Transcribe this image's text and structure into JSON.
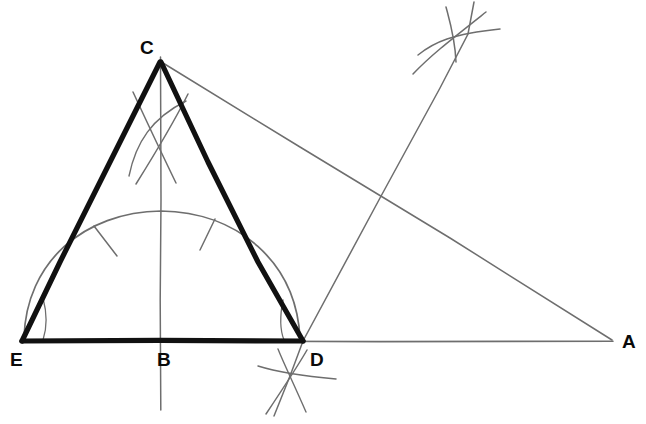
{
  "figure": {
    "canvas": {
      "width": 646,
      "height": 424
    },
    "colors": {
      "background": "#ffffff",
      "heavy_stroke": "#111111",
      "light_stroke": "#6e6e6e",
      "label_text": "#0a0a0a"
    },
    "points": {
      "C": {
        "label": "C",
        "x": 161,
        "y": 62,
        "label_x": 140,
        "label_y": 38
      },
      "E": {
        "label": "E",
        "x": 22,
        "y": 341,
        "label_x": 10,
        "label_y": 350
      },
      "B": {
        "label": "B",
        "x": 161,
        "y": 341,
        "label_x": 157,
        "label_y": 350
      },
      "D": {
        "label": "D",
        "x": 303,
        "y": 341,
        "label_x": 310,
        "label_y": 350
      },
      "A": {
        "label": "A",
        "x": 613,
        "y": 341,
        "label_x": 622,
        "label_y": 332
      }
    },
    "segments": [
      {
        "name": "triangle-side-CE",
        "from": "C",
        "to": "E",
        "weight": "heavy"
      },
      {
        "name": "triangle-side-CD",
        "from": "C",
        "to": "D",
        "weight": "heavy"
      },
      {
        "name": "triangle-base-ED",
        "from": "E",
        "to": "D",
        "weight": "heavy"
      },
      {
        "name": "baseline-DA",
        "from": "D",
        "to": "A",
        "weight": "light"
      },
      {
        "name": "hypotenuse-CA",
        "from": "C",
        "to": "A",
        "weight": "light"
      },
      {
        "name": "vertical-axis-through-B",
        "weight": "light"
      },
      {
        "name": "oblique-bisector-through-D",
        "weight": "light"
      }
    ],
    "arcs": {
      "semicircle_ED": {
        "name": "semicircle-on-ED",
        "center_x": 161,
        "center_y": 341,
        "radius": 141
      },
      "tick_left": {
        "name": "semicircle-tick-left"
      },
      "tick_right": {
        "name": "semicircle-tick-right"
      },
      "cross_below_C": {
        "name": "construction-cross-below-c",
        "x": 159,
        "y": 122
      },
      "cross_top_right": {
        "name": "construction-cross-top-right",
        "x": 458,
        "y": 35
      },
      "cross_below_D": {
        "name": "construction-cross-below-d",
        "x": 290,
        "y": 375
      }
    }
  }
}
